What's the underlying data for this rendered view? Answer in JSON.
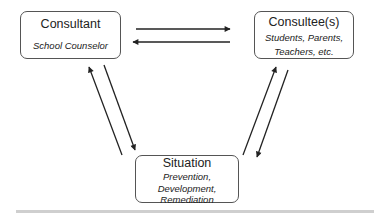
{
  "diagram": {
    "nodes": {
      "consultant": {
        "title": "Consultant",
        "subtitle": [
          "School Counselor"
        ]
      },
      "consultee": {
        "title": "Consultee(s)",
        "subtitle": [
          "Students, Parents,",
          "Teachers, etc."
        ]
      },
      "situation": {
        "title": "Situation",
        "subtitle": [
          "Prevention,",
          "Development,",
          "Remediation"
        ]
      }
    },
    "edges": [
      {
        "from": "consultant",
        "to": "consultee",
        "style": "arrow"
      },
      {
        "from": "consultee",
        "to": "consultant",
        "style": "arrow"
      },
      {
        "from": "consultant",
        "to": "situation",
        "style": "arrow"
      },
      {
        "from": "situation",
        "to": "consultant",
        "style": "arrow"
      },
      {
        "from": "consultee",
        "to": "situation",
        "style": "arrow"
      },
      {
        "from": "situation",
        "to": "consultee",
        "style": "arrow"
      }
    ],
    "colors": {
      "line": "#222222",
      "border": "#555555",
      "bar": "#cfcfcf"
    }
  }
}
